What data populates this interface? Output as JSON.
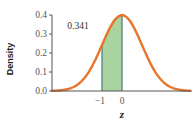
{
  "chart_data": {
    "type": "area",
    "title": "",
    "xlabel": "z",
    "ylabel": "Density",
    "distribution": "standard normal",
    "mean": 0,
    "sd": 1,
    "ylim": [
      0.0,
      0.4
    ],
    "xlim": [
      -3.5,
      3.4
    ],
    "y_ticks": [
      "0.0",
      "0.1",
      "0.2",
      "0.3",
      "0.4"
    ],
    "x_ticks": [
      "−1",
      "0"
    ],
    "x_tick_values": [
      -1,
      0
    ],
    "shaded_region": {
      "from": -1,
      "to": 0,
      "area_label": "0.341"
    },
    "annotations": [
      {
        "text": "0.341",
        "x": -1.6,
        "y": 0.36
      }
    ],
    "grid": false,
    "legend": null,
    "colors": {
      "curve": "#e8742a",
      "fill": "#a9d4a0",
      "edge_lines": "#3f6f73",
      "axis": "#555555"
    }
  }
}
